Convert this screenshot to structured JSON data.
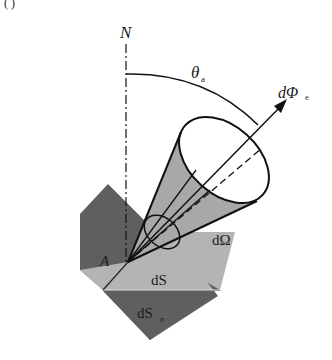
{
  "figure": {
    "top_fragment": "(          )",
    "labels": {
      "normal": "N",
      "angle": "θ",
      "angle_sub": "a",
      "flux": "dΦ",
      "flux_sub": "e",
      "solid_angle": "dΩ",
      "point": "A",
      "area": "dS",
      "projected_area": "dS",
      "projected_area_sub": "n"
    },
    "colors": {
      "dark_plane": "#5f5f5f",
      "light_plane": "#b4b4b4",
      "cone_fill": "#a8a8a8",
      "line": "#111111"
    }
  }
}
